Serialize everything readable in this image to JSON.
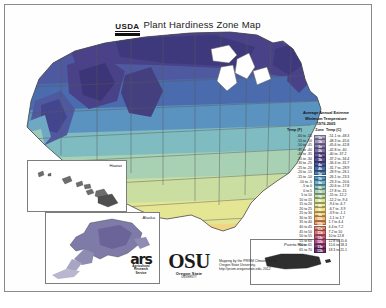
{
  "title": {
    "agency": "USDA",
    "text": "Plant Hardiness Zone Map"
  },
  "legend": {
    "header_line1": "Average Annual Extreme",
    "header_line2": "Minimum Temperature",
    "header_line3": "1976-2005",
    "col_f": "Temp (F)",
    "col_zone": "Zone",
    "col_c": "Temp (C)",
    "rows": [
      {
        "f": "-60 to -55",
        "zone": "1a",
        "c": "-51.1 to -48.3",
        "color": "#b0a8c8"
      },
      {
        "f": "-55 to -50",
        "zone": "1b",
        "c": "-48.3 to -45.6",
        "color": "#9f93bd"
      },
      {
        "f": "-50 to -45",
        "zone": "2a",
        "c": "-45.6 to -42.8",
        "color": "#8d7fb2"
      },
      {
        "f": "-45 to -40",
        "zone": "2b",
        "c": "-42.8 to -40",
        "color": "#7b6ca8"
      },
      {
        "f": "-40 to -35",
        "zone": "3a",
        "c": "-40 to -37.2",
        "color": "#6a5a9e"
      },
      {
        "f": "-35 to -30",
        "zone": "3b",
        "c": "-37.2 to -34.4",
        "color": "#5a4c96"
      },
      {
        "f": "-30 to -25",
        "zone": "4a",
        "c": "-34.4 to -31.7",
        "color": "#4f5aa0"
      },
      {
        "f": "-25 to -20",
        "zone": "4b",
        "c": "-31.7 to -28.9",
        "color": "#4a6bae"
      },
      {
        "f": "-20 to -15",
        "zone": "5a",
        "c": "-28.9 to -26.1",
        "color": "#4d82bb"
      },
      {
        "f": "-15 to -10",
        "zone": "5b",
        "c": "-26.1 to -23.3",
        "color": "#589ac6"
      },
      {
        "f": "-10 to -5",
        "zone": "6a",
        "c": "-23.3 to -20.6",
        "color": "#6fb0c9"
      },
      {
        "f": "-5 to 0",
        "zone": "6b",
        "c": "-20.6 to -17.8",
        "color": "#8cc4c2"
      },
      {
        "f": "0 to 5",
        "zone": "7a",
        "c": "-17.8 to -15",
        "color": "#a9d2b4"
      },
      {
        "f": "5 to 10",
        "zone": "7b",
        "c": "-15 to -12.2",
        "color": "#c3dda6"
      },
      {
        "f": "10 to 15",
        "zone": "8a",
        "c": "-12.2 to -9.4",
        "color": "#d8e49a"
      },
      {
        "f": "15 to 20",
        "zone": "8b",
        "c": "-9.4 to -6.7",
        "color": "#e9e892"
      },
      {
        "f": "20 to 25",
        "zone": "9a",
        "c": "-6.7 to -3.9",
        "color": "#f2e086"
      },
      {
        "f": "25 to 30",
        "zone": "9b",
        "c": "-3.9 to -1.1",
        "color": "#f6cf79"
      },
      {
        "f": "30 to 35",
        "zone": "10a",
        "c": "-1.1 to 1.7",
        "color": "#f5b96e"
      },
      {
        "f": "35 to 40",
        "zone": "10b",
        "c": "1.7 to 4.4",
        "color": "#f0a06a"
      },
      {
        "f": "40 to 45",
        "zone": "11a",
        "c": "4.4 to 7.2",
        "color": "#e8896f"
      },
      {
        "f": "45 to 50",
        "zone": "11b",
        "c": "7.2 to 10",
        "color": "#dd7278"
      },
      {
        "f": "50 to 55",
        "zone": "12a",
        "c": "10 to 12.8",
        "color": "#cc5f82"
      },
      {
        "f": "55 to 60",
        "zone": "12b",
        "c": "12.8 to 15.6",
        "color": "#b54f88"
      },
      {
        "f": "60 to 65",
        "zone": "13a",
        "c": "15.6 to 18.3",
        "color": "#93407f"
      },
      {
        "f": "65 to 70",
        "zone": "13b",
        "c": "18.3 to 21.1",
        "color": "#6d2f6b"
      }
    ]
  },
  "insets": {
    "hawaii": "Hawaii",
    "alaska": "Alaska",
    "puerto_rico": "Puerto Rico"
  },
  "credits": {
    "ars_mark": "ars",
    "ars_line1": "Agricultural",
    "ars_line2": "Research",
    "ars_line3": "Service",
    "osu_mark": "OSU",
    "osu_sub": "Oregon State",
    "osu_sub2": "UNIVERSITY",
    "attribution": "Mapping by the PRISM Climate Group, Oregon State University, http://prism.oregonstate.edu, 2012"
  }
}
